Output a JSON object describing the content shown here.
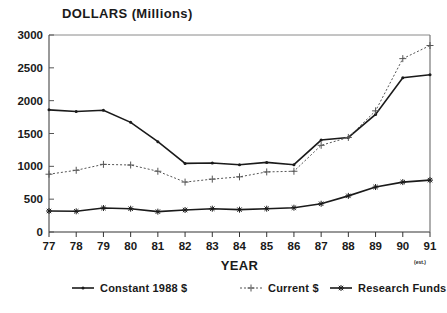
{
  "chart_data": {
    "type": "line",
    "title": "DOLLARS (Millions)",
    "xlabel": "YEAR",
    "ylabel": "",
    "xlim": [
      77,
      91
    ],
    "ylim": [
      0,
      3000
    ],
    "grid": false,
    "legend_position": "bottom",
    "x": [
      77,
      78,
      79,
      80,
      81,
      82,
      83,
      84,
      85,
      86,
      87,
      88,
      89,
      90,
      91
    ],
    "categories": [
      "77",
      "78",
      "79",
      "80",
      "81",
      "82",
      "83",
      "84",
      "85",
      "86",
      "87",
      "88",
      "89",
      "90",
      "91"
    ],
    "xtick_labels": [
      "77",
      "78",
      "79",
      "80",
      "81",
      "82",
      "83",
      "84",
      "85",
      "86",
      "87",
      "88",
      "89",
      "90",
      "91"
    ],
    "ytick_labels": [
      "0",
      "500",
      "1000",
      "1500",
      "2000",
      "2500",
      "3000"
    ],
    "ytick_values": [
      0,
      500,
      1000,
      1500,
      2000,
      2500,
      3000
    ],
    "footnote": "(est.)",
    "series": [
      {
        "name": "Constant 1988 $",
        "style": "solid",
        "marker": "dot",
        "color": "#1a1a1a",
        "values": [
          1860,
          1835,
          1855,
          1670,
          1375,
          1045,
          1050,
          1025,
          1060,
          1025,
          1400,
          1440,
          1790,
          2350,
          2395
        ]
      },
      {
        "name": "Current $",
        "style": "dotted",
        "marker": "plus",
        "color": "#555555",
        "values": [
          880,
          940,
          1030,
          1020,
          925,
          760,
          805,
          840,
          915,
          925,
          1320,
          1440,
          1845,
          2640,
          2840
        ]
      },
      {
        "name": "Research Funds",
        "style": "solid",
        "marker": "star",
        "color": "#1a1a1a",
        "values": [
          320,
          315,
          365,
          355,
          310,
          335,
          355,
          340,
          355,
          370,
          430,
          550,
          685,
          760,
          790
        ]
      }
    ]
  },
  "legend": {
    "items": [
      {
        "label": "Constant 1988 $"
      },
      {
        "label": "Current $"
      },
      {
        "label": "Research Funds"
      }
    ]
  }
}
